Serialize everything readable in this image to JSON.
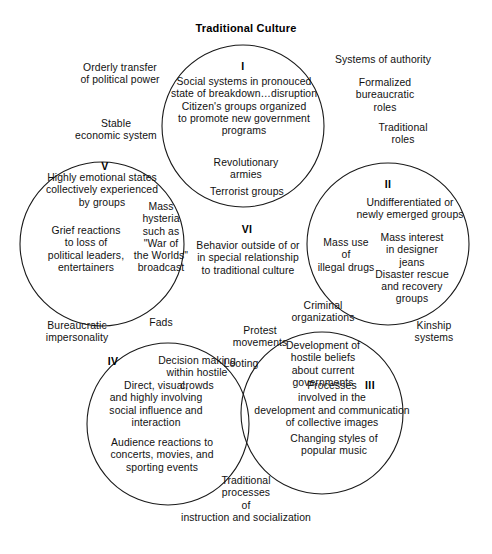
{
  "diagram": {
    "title": "Traditional Culture",
    "type": "venn-5-circle",
    "stroke_color": "#1a1a1a",
    "background_color": "#ffffff",
    "text_color": "#111111",
    "circles": [
      {
        "id": "I",
        "cx": 243,
        "cy": 126,
        "r": 81
      },
      {
        "id": "II",
        "cx": 388,
        "cy": 244,
        "r": 81
      },
      {
        "id": "III",
        "cx": 322,
        "cy": 413,
        "r": 81
      },
      {
        "id": "IV",
        "cx": 168,
        "cy": 424,
        "r": 81
      },
      {
        "id": "V",
        "cx": 102,
        "cy": 244,
        "r": 82
      }
    ]
  },
  "roman_numerals": {
    "one": "I",
    "two": "II",
    "three": "III",
    "four": "IV",
    "five": "V",
    "six": "VI"
  },
  "circle_contents": {
    "one": "Social systems in pronouced\nstate of breakdown…disruption\nCitizen's groups organized\nto promote new government\nprograms",
    "two": "Undifferentiated or\nnewly emerged groups",
    "two_extra": "Mass interest\nin designer\njeans\nDisaster rescue\nand recovery\ngroups",
    "three": "Processes\ninvolved in the\ndevelopment and communication\nof collective images",
    "three_extra": "Changing styles of\npopular music",
    "four": "Direct, visual,\nand highly involving\nsocial influence and\ninteraction",
    "four_extra": "Audience reactions to\nconcerts, movies, and\nsporting events",
    "five": "Highly emotional states\ncollectively experienced\nby groups",
    "five_extra": "Grief reactions\nto loss of\npolitical leaders,\nentertainers",
    "six": "Behavior outside of or\nin special relationship\nto traditional culture"
  },
  "overlap_labels": {
    "one_two": "Revolutionary\narmies",
    "one_two_b": "Terrorist groups",
    "five_one": "Mass\nhysteria\nsuch as\n\"War of\nthe Worlds\"\nbroadcast",
    "two_three": "Mass use\nof\nillegal drugs",
    "three_two_lower": "Criminal\norganizations",
    "three_four": "Development of\nhostile beliefs\nabout current\ngovernments",
    "four_five": "Decision making\nwithin hostile\ncrowds",
    "center_protest": "Protest\nmovements",
    "center_looting": "Looting",
    "five_four_fads": "Fads"
  },
  "outside_labels": {
    "top_left": "Orderly transfer\nof political power",
    "left_upper": "Stable\neconomic system",
    "top_right": "Systems of authority",
    "right_upper": "Formalized\nbureaucratic\nroles",
    "right_mid": "Traditional\nroles",
    "left_lower": "Bureaucratic\nimpersonality",
    "right_lower": "Kinship\nsystems",
    "bottom": "Traditional\nprocesses\nof\ninstruction and socialization"
  }
}
